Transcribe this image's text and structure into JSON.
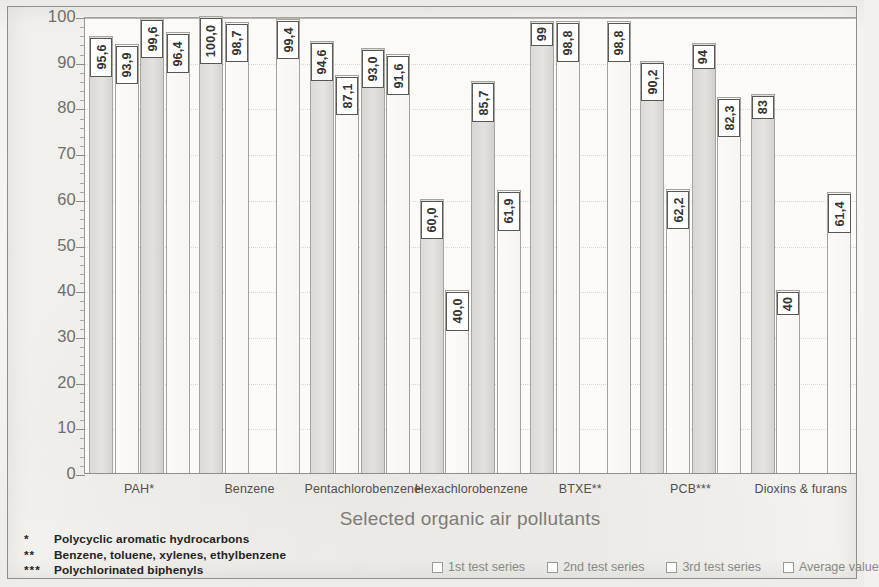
{
  "chart_data": {
    "type": "bar",
    "title": "",
    "xlabel": "Selected organic air pollutants",
    "ylabel": "Elimination efficiency / [%]",
    "ylim": [
      0,
      100
    ],
    "ytick_step": 10,
    "yticks": [
      "0",
      "10",
      "20",
      "30",
      "40",
      "50",
      "60",
      "70",
      "80",
      "90",
      "100"
    ],
    "grid": true,
    "legend_position": "bottom",
    "categories": [
      "PAH*",
      "Benzene",
      "Pentachlorobenzene",
      "Hexachlorobenzene",
      "BTXE**",
      "PCB***",
      "Dioxins & furans"
    ],
    "series": [
      {
        "name": "1st test series",
        "values": [
          95.6,
          100.0,
          94.6,
          60.0,
          99.0,
          90.2,
          83.0
        ],
        "labels": [
          "95,6",
          "100,0",
          "94,6",
          "60,0",
          "99",
          "90,2",
          "83"
        ]
      },
      {
        "name": "2nd test series",
        "values": [
          93.9,
          98.7,
          87.1,
          40.0,
          98.8,
          62.2,
          40.0
        ],
        "labels": [
          "93,9",
          "98,7",
          "87,1",
          "40,0",
          "98,8",
          "62,2",
          "40"
        ]
      },
      {
        "name": "3rd test series",
        "values": [
          99.6,
          null,
          93.0,
          85.7,
          null,
          94.0,
          null
        ],
        "labels": [
          "99,6",
          "",
          "93,0",
          "85,7",
          "",
          "94",
          ""
        ]
      },
      {
        "name": "Average value",
        "values": [
          96.4,
          99.4,
          91.6,
          61.9,
          98.8,
          82.3,
          61.4
        ],
        "labels": [
          "96,4",
          "99,4",
          "91,6",
          "61,9",
          "98,8",
          "82,3",
          "61,4"
        ]
      }
    ]
  },
  "legend": {
    "items": [
      {
        "label": "1st test series"
      },
      {
        "label": "2nd test series"
      },
      {
        "label": "3rd test series"
      },
      {
        "label": "Average value"
      }
    ]
  },
  "footnotes": [
    {
      "marker": "*",
      "text": "Polycyclic aromatic hydrocarbons"
    },
    {
      "marker": "**",
      "text": "Benzene, toluene, xylenes, ethylbenzene"
    },
    {
      "marker": "***",
      "text": "Polychlorinated biphenyls"
    }
  ]
}
